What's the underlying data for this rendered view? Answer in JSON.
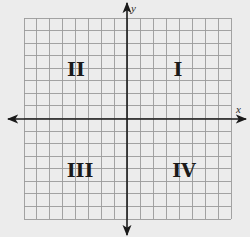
{
  "diagram": {
    "axes": {
      "x_label": "x",
      "y_label": "y"
    },
    "grid": {
      "columns": 16,
      "rows": 16,
      "line_color": "#9a9a9a",
      "axis_color": "#1a1a1a",
      "background": "#ececec"
    },
    "quadrants": [
      {
        "id": "I",
        "label": "I",
        "position": "top-right"
      },
      {
        "id": "II",
        "label": "II",
        "position": "top-left"
      },
      {
        "id": "III",
        "label": "III",
        "position": "bottom-left"
      },
      {
        "id": "IV",
        "label": "IV",
        "position": "bottom-right"
      }
    ]
  }
}
